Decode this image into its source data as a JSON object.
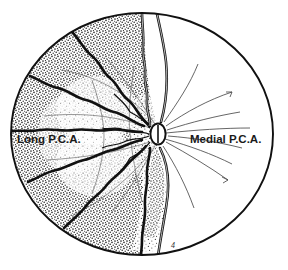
{
  "figure": {
    "title_visible": false,
    "background_color": "#ffffff",
    "ink_color": "#111111",
    "stipple_color": "#2b2b2b",
    "labels": {
      "left": "Long P.C.A.",
      "right": "Medial P.C.A."
    },
    "signature_mark": "4",
    "optic_disc": {
      "name": "optic-disc",
      "cx": 158,
      "cy": 134,
      "rx": 7.5,
      "ry": 10.5,
      "fill": "#ffffff",
      "stroke": "#111111"
    },
    "outer_boundary": {
      "name": "globe-outline",
      "cx": 142,
      "cy": 134,
      "rx": 131,
      "ry": 121
    },
    "regions": [
      {
        "id": "long-pca-territory",
        "label": "Long P.C.A.",
        "shading": "stippled",
        "side": "left"
      },
      {
        "id": "medial-pca-territory",
        "label": "Medial P.C.A.",
        "shading": "clear",
        "side": "right"
      }
    ],
    "vessel_count": 7,
    "sector_count": 8
  }
}
